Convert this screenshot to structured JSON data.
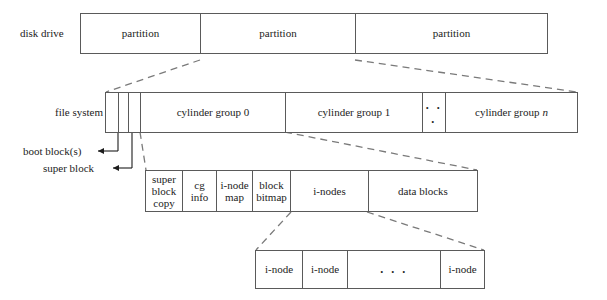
{
  "diagram": {
    "rows": {
      "disk_drive": {
        "label": "disk drive",
        "cells": [
          {
            "text": "partition"
          },
          {
            "text": "partition"
          },
          {
            "text": "partition"
          }
        ]
      },
      "file_system": {
        "label": "file system",
        "cells": [
          {
            "text": ""
          },
          {
            "text": ""
          },
          {
            "text": ""
          },
          {
            "text": "cylinder group 0"
          },
          {
            "text": "cylinder group 1"
          },
          {
            "text": ". . ."
          },
          {
            "text": "cylinder group",
            "italic_suffix": "n"
          }
        ]
      },
      "cylinder_group": {
        "cells": [
          {
            "lines": [
              "super",
              "block",
              "copy"
            ]
          },
          {
            "lines": [
              "cg",
              "info"
            ]
          },
          {
            "lines": [
              "i-node",
              "map"
            ]
          },
          {
            "lines": [
              "block",
              "bitmap"
            ]
          },
          {
            "lines": [
              "i-nodes"
            ]
          },
          {
            "lines": [
              "data blocks"
            ]
          }
        ]
      },
      "inode_list": {
        "cells": [
          {
            "text": "i-node"
          },
          {
            "text": "i-node"
          },
          {
            "text": ". . ."
          },
          {
            "text": "i-node"
          }
        ]
      }
    },
    "callouts": [
      {
        "text": "boot block(s)"
      },
      {
        "text": "super block"
      }
    ],
    "colors": {
      "stroke": "#5a5a5a",
      "text": "#1c1c1c",
      "dashed": "#7a7a7a",
      "background": "#ffffff"
    }
  }
}
